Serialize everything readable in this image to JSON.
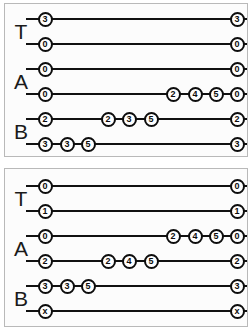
{
  "diagram": {
    "node_colors": {
      "fill": "#ffffff",
      "stroke": "#0d0d0d",
      "text": "#0d0d0d"
    },
    "line_color": "#111111",
    "panel_background": "#fcfcfc",
    "panel_border": "#b9b9b9"
  },
  "panels": [
    {
      "id": "panel-top",
      "groups": [
        {
          "label": "T",
          "label_y": 27
        },
        {
          "label": "A",
          "label_y": 77
        },
        {
          "label": "B",
          "label_y": 127
        }
      ],
      "rows": [
        {
          "id": "top-row-1",
          "y": 15,
          "group": "T",
          "nodes": [
            {
              "x": 40,
              "value": "3"
            },
            {
              "x": 232,
              "value": "3"
            }
          ]
        },
        {
          "id": "top-row-2",
          "y": 40,
          "group": "T",
          "nodes": [
            {
              "x": 40,
              "value": "0"
            },
            {
              "x": 232,
              "value": "0"
            }
          ]
        },
        {
          "id": "top-row-3",
          "y": 65,
          "group": "A",
          "nodes": [
            {
              "x": 40,
              "value": "0"
            },
            {
              "x": 232,
              "value": "0"
            }
          ]
        },
        {
          "id": "top-row-4",
          "y": 90,
          "group": "A",
          "nodes": [
            {
              "x": 40,
              "value": "0"
            },
            {
              "x": 168,
              "value": "2"
            },
            {
              "x": 190,
              "value": "4"
            },
            {
              "x": 211,
              "value": "5"
            },
            {
              "x": 232,
              "value": "0"
            }
          ]
        },
        {
          "id": "top-row-5",
          "y": 115,
          "group": "B",
          "nodes": [
            {
              "x": 40,
              "value": "2"
            },
            {
              "x": 103,
              "value": "2"
            },
            {
              "x": 124,
              "value": "3"
            },
            {
              "x": 146,
              "value": "5"
            },
            {
              "x": 232,
              "value": "2"
            }
          ]
        },
        {
          "id": "top-row-6",
          "y": 140,
          "group": "B",
          "nodes": [
            {
              "x": 40,
              "value": "3"
            },
            {
              "x": 62,
              "value": "3"
            },
            {
              "x": 83,
              "value": "5"
            },
            {
              "x": 232,
              "value": "3"
            }
          ]
        }
      ]
    },
    {
      "id": "panel-bottom",
      "groups": [
        {
          "label": "T",
          "label_y": 29
        },
        {
          "label": "A",
          "label_y": 79
        },
        {
          "label": "B",
          "label_y": 129
        }
      ],
      "rows": [
        {
          "id": "bottom-row-1",
          "y": 17,
          "group": "T",
          "nodes": [
            {
              "x": 40,
              "value": "0"
            },
            {
              "x": 232,
              "value": "0"
            }
          ]
        },
        {
          "id": "bottom-row-2",
          "y": 42,
          "group": "T",
          "nodes": [
            {
              "x": 40,
              "value": "1"
            },
            {
              "x": 232,
              "value": "1"
            }
          ]
        },
        {
          "id": "bottom-row-3",
          "y": 67,
          "group": "A",
          "nodes": [
            {
              "x": 40,
              "value": "0"
            },
            {
              "x": 168,
              "value": "2"
            },
            {
              "x": 190,
              "value": "4"
            },
            {
              "x": 211,
              "value": "5"
            },
            {
              "x": 232,
              "value": "0"
            }
          ]
        },
        {
          "id": "bottom-row-4",
          "y": 92,
          "group": "A",
          "nodes": [
            {
              "x": 40,
              "value": "2"
            },
            {
              "x": 103,
              "value": "2"
            },
            {
              "x": 124,
              "value": "4"
            },
            {
              "x": 146,
              "value": "5"
            },
            {
              "x": 232,
              "value": "2"
            }
          ]
        },
        {
          "id": "bottom-row-5",
          "y": 117,
          "group": "B",
          "nodes": [
            {
              "x": 40,
              "value": "3"
            },
            {
              "x": 62,
              "value": "3"
            },
            {
              "x": 83,
              "value": "5"
            },
            {
              "x": 232,
              "value": "3"
            }
          ]
        },
        {
          "id": "bottom-row-6",
          "y": 142,
          "group": "B",
          "nodes": [
            {
              "x": 40,
              "value": "x"
            },
            {
              "x": 232,
              "value": "x"
            }
          ]
        }
      ]
    }
  ]
}
